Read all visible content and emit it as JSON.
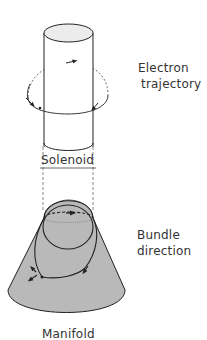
{
  "labels": {
    "electron_trajectory_line1": "Electron",
    "electron_trajectory_line2": "trajectory",
    "solenoid": "Solenoid",
    "bundle_direction_line1": "Bundle",
    "bundle_direction_line2": "direction",
    "manifold": "Manifold"
  },
  "colors": {
    "stroke": "#222222",
    "manifold_fill": "#b9b9b9",
    "solenoid_top_fill": "#ececec",
    "background": "#ffffff"
  }
}
